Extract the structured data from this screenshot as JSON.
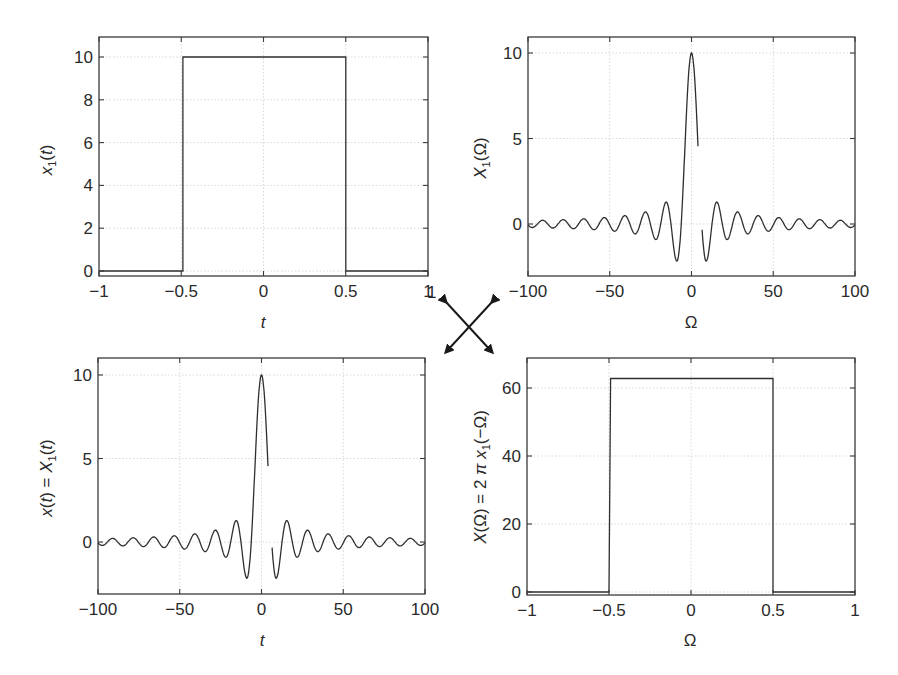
{
  "figure": {
    "arrows": {
      "label_left": "1",
      "label_right": "−1"
    },
    "panels": [
      {
        "id": "top-left",
        "ylabel_parts": [
          "x",
          "1",
          "(",
          "t",
          ")"
        ],
        "ylabel": "x1(t)",
        "xlabel": "t",
        "xlabel_italic": true
      },
      {
        "id": "top-right",
        "ylabel": "X1(Ω)",
        "xlabel": "Ω",
        "xlabel_italic": false
      },
      {
        "id": "bottom-left",
        "ylabel": "x(t) = X1(t)",
        "xlabel": "t",
        "xlabel_italic": true
      },
      {
        "id": "bottom-right",
        "ylabel": "X(Ω) = 2π x1(−Ω)",
        "xlabel": "Ω",
        "xlabel_italic": false
      }
    ]
  },
  "chart_data": [
    {
      "type": "line",
      "title": "",
      "xlabel": "t",
      "ylabel": "x1(t)",
      "xlim": [
        -1,
        1
      ],
      "ylim": [
        -0.3,
        11
      ],
      "xticks": [
        -1,
        -0.5,
        0,
        0.5,
        1
      ],
      "xtick_labels": [
        "−1",
        "−0.5",
        "0",
        "0.5",
        "1"
      ],
      "yticks": [
        0,
        2,
        4,
        6,
        8,
        10
      ],
      "ytick_labels": [
        "0",
        "2",
        "4",
        "6",
        "8",
        "10"
      ],
      "grid": true,
      "series": [
        {
          "name": "x1(t)",
          "x": [
            -1,
            -0.49,
            -0.49,
            0.5,
            0.5,
            1
          ],
          "y": [
            0,
            0,
            10,
            10,
            0,
            0
          ]
        }
      ]
    },
    {
      "type": "line",
      "title": "",
      "xlabel": "Ω",
      "ylabel": "X1(Ω)",
      "xlim": [
        -100,
        100
      ],
      "ylim": [
        -3,
        11
      ],
      "xticks": [
        -100,
        -50,
        0,
        50,
        100
      ],
      "xtick_labels": [
        "−100",
        "−50",
        "0",
        "50",
        "100"
      ],
      "yticks": [
        0,
        5,
        10
      ],
      "ytick_labels": [
        "0",
        "5",
        "10"
      ],
      "grid": true,
      "series": [
        {
          "name": "X1(Ω) = 20 sin(Ω/2)/Ω",
          "formula": "sinc",
          "amplitude": 10,
          "half_width": 0.5,
          "x_range": [
            -100,
            100
          ],
          "gap": [
            4,
            6.5
          ],
          "key_points": {
            "peak": [
              0,
              10
            ],
            "first_min_left": [
              -9,
              -2.2
            ],
            "first_min_right": [
              9,
              -2.2
            ],
            "second_max": [
              15.5,
              1.3
            ]
          }
        }
      ]
    },
    {
      "type": "line",
      "title": "",
      "xlabel": "t",
      "ylabel": "x(t) = X1(t)",
      "xlim": [
        -100,
        100
      ],
      "ylim": [
        -3,
        11
      ],
      "xticks": [
        -100,
        -50,
        0,
        50,
        100
      ],
      "xtick_labels": [
        "−100",
        "−50",
        "0",
        "50",
        "100"
      ],
      "yticks": [
        0,
        5,
        10
      ],
      "ytick_labels": [
        "0",
        "5",
        "10"
      ],
      "grid": true,
      "series": [
        {
          "name": "x(t)",
          "formula": "sinc",
          "amplitude": 10,
          "half_width": 0.5,
          "x_range": [
            -100,
            100
          ],
          "gap": [
            4,
            6.5
          ],
          "key_points": {
            "peak": [
              0,
              10
            ],
            "first_min_left": [
              -9,
              -2.2
            ],
            "first_min_right": [
              9,
              -2.2
            ],
            "second_max": [
              15.5,
              1.3
            ]
          }
        }
      ]
    },
    {
      "type": "line",
      "title": "",
      "xlabel": "Ω",
      "ylabel": "X(Ω) = 2π x1(−Ω)",
      "xlim": [
        -1,
        1
      ],
      "ylim": [
        -1,
        69
      ],
      "xticks": [
        -1,
        -0.5,
        0,
        0.5,
        1
      ],
      "xtick_labels": [
        "−1",
        "−0.5",
        "0",
        "0.5",
        "1"
      ],
      "yticks": [
        0,
        20,
        40,
        60
      ],
      "ytick_labels": [
        "0",
        "20",
        "40",
        "60"
      ],
      "grid": true,
      "series": [
        {
          "name": "X(Ω)",
          "x": [
            -1,
            -0.5,
            -0.49,
            0.5,
            0.5,
            1
          ],
          "y": [
            0,
            0,
            62.8,
            62.8,
            0,
            0
          ]
        }
      ]
    }
  ]
}
